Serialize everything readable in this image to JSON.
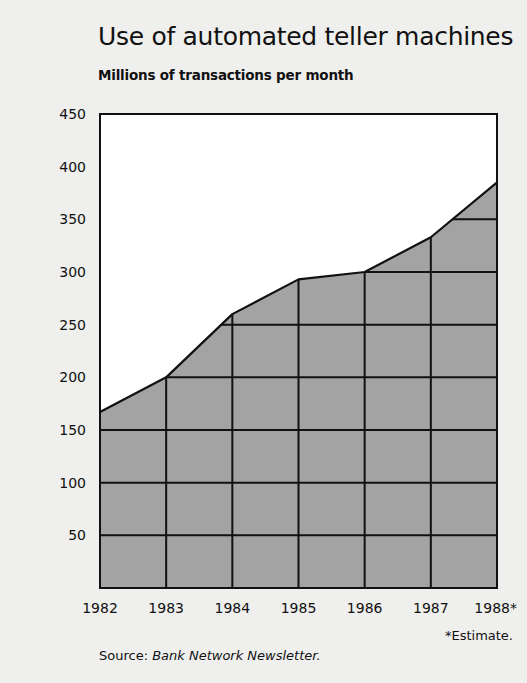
{
  "chart_data": {
    "type": "area",
    "title": "Use of automated teller machines",
    "subtitle": "Millions of transactions per month",
    "xlabel": "",
    "ylabel": "Millions of transactions per month",
    "categories": [
      "1982",
      "1983",
      "1984",
      "1985",
      "1986",
      "1987",
      "1988*"
    ],
    "x": [
      1982,
      1983,
      1984,
      1985,
      1986,
      1987,
      1988
    ],
    "values": [
      167,
      200,
      260,
      293,
      300,
      333,
      385
    ],
    "ylim": [
      0,
      450
    ],
    "yticks": [
      50,
      100,
      150,
      200,
      250,
      300,
      350,
      400,
      450
    ],
    "grid": true,
    "legend": null,
    "annotations": [
      "*Estimate.",
      "Source: Bank Network Newsletter."
    ],
    "colors": {
      "fill": "#a3a3a3",
      "line": "#111111",
      "background": "#efefed",
      "plot_bg": "#ffffff"
    }
  },
  "footnote": "*Estimate.",
  "source": {
    "prefix": "Source:",
    "name": "Bank Network Newsletter."
  }
}
